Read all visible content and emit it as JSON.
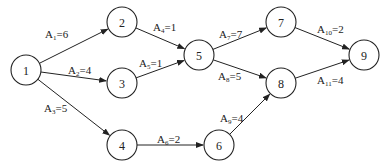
{
  "diagram": {
    "type": "activity-on-arrow network",
    "nodes": [
      {
        "id": "1",
        "label": "1",
        "x": 26,
        "y": 70
      },
      {
        "id": "2",
        "label": "2",
        "x": 122,
        "y": 22
      },
      {
        "id": "3",
        "label": "3",
        "x": 122,
        "y": 83
      },
      {
        "id": "4",
        "label": "4",
        "x": 122,
        "y": 145
      },
      {
        "id": "5",
        "label": "5",
        "x": 199,
        "y": 55
      },
      {
        "id": "6",
        "label": "6",
        "x": 219,
        "y": 145
      },
      {
        "id": "7",
        "label": "7",
        "x": 281,
        "y": 22
      },
      {
        "id": "8",
        "label": "8",
        "x": 281,
        "y": 83
      },
      {
        "id": "9",
        "label": "9",
        "x": 364,
        "y": 55
      }
    ],
    "edges": [
      {
        "from": "1",
        "to": "2",
        "name": "A",
        "sub": "1",
        "value": "=6",
        "lx": 45,
        "ly": 38
      },
      {
        "from": "1",
        "to": "3",
        "name": "A",
        "sub": "2",
        "value": "=4",
        "lx": 68,
        "ly": 74
      },
      {
        "from": "1",
        "to": "4",
        "name": "A",
        "sub": "3",
        "value": "=5",
        "lx": 44,
        "ly": 112
      },
      {
        "from": "2",
        "to": "5",
        "name": "A",
        "sub": "4",
        "value": "=1",
        "lx": 153,
        "ly": 31
      },
      {
        "from": "3",
        "to": "5",
        "name": "A",
        "sub": "5",
        "value": "=1",
        "lx": 139,
        "ly": 67
      },
      {
        "from": "4",
        "to": "6",
        "name": "A",
        "sub": "6",
        "value": "=2",
        "lx": 157,
        "ly": 143
      },
      {
        "from": "5",
        "to": "7",
        "name": "A",
        "sub": "7",
        "value": "=7",
        "lx": 219,
        "ly": 38
      },
      {
        "from": "5",
        "to": "8",
        "name": "A",
        "sub": "8",
        "value": "=5",
        "lx": 218,
        "ly": 80
      },
      {
        "from": "6",
        "to": "8",
        "name": "A",
        "sub": "9",
        "value": "=4",
        "lx": 220,
        "ly": 122
      },
      {
        "from": "7",
        "to": "9",
        "name": "A",
        "sub": "10",
        "value": "=2",
        "lx": 317,
        "ly": 33
      },
      {
        "from": "8",
        "to": "9",
        "name": "A",
        "sub": "11",
        "value": "=4",
        "lx": 317,
        "ly": 84
      }
    ]
  }
}
